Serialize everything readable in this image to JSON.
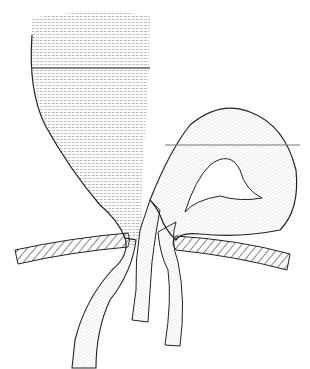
{
  "image": {
    "description": "Anatomical line illustration: large bulbous pouch above, curved tubular loop to the right, three tubes passing through a hatched band (diaphragm/wall) with openings",
    "colors": {
      "background": "#ffffff",
      "outline": "#222222",
      "hatching": "#555555"
    }
  }
}
